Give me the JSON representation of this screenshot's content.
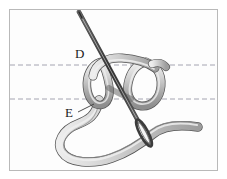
{
  "figure": {
    "kind": "embroidery-stitch-diagram",
    "title": "",
    "background_color": "#fdfdfd",
    "frame_color": "#b9b9b9",
    "ink_color": "#4a4a4a",
    "thread_fill": "#c9c9c9",
    "needle_color": "#3a3a3a",
    "guide_line_color": "#9a9aa8"
  },
  "labels": [
    {
      "id": "D",
      "text": "D",
      "x": 75,
      "y": 47
    },
    {
      "id": "E",
      "text": "E",
      "x": 65,
      "y": 106
    }
  ],
  "guide_lines": [
    {
      "id": "upper-guide",
      "y": 65,
      "x_start": 10,
      "x_end": 217,
      "style": "dashed"
    },
    {
      "id": "lower-guide",
      "y": 99,
      "x_start": 10,
      "x_end": 217,
      "style": "dashed"
    }
  ],
  "leader_lines": [
    {
      "id": "e-leader",
      "from_x": 78,
      "from_y": 112,
      "to_x": 93,
      "to_y": 104
    }
  ],
  "elements": [
    {
      "name": "needle",
      "description": "sewing needle angled from upper-left to lower-right with elongated eye near lower end"
    },
    {
      "name": "thread-knot",
      "description": "thread forming a knot with a left loop and a right loop joined by an upper arch"
    },
    {
      "name": "thread-tail-lower",
      "description": "thread sweeping down-left into a wide U and out to the right"
    },
    {
      "name": "thread-tail-right",
      "description": "thread tail exiting to the right edge"
    }
  ]
}
